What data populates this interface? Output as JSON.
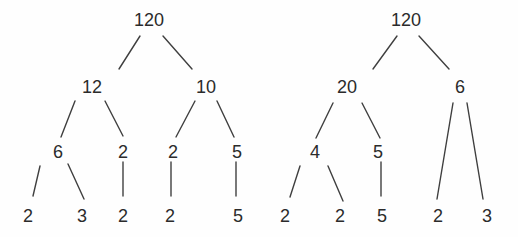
{
  "figure": {
    "background_color": "#fefefe",
    "line_color": "#3f3f3f",
    "text_color": "#2b2b2b",
    "line_width": 1.4,
    "trees": [
      {
        "name": "factor-tree-left",
        "root_value": "120",
        "factorization": "120 = 12 x 10, 12 = 6 x 2, 10 = 2 x 5, 6 = 2 x 3",
        "prime_leaves": [
          "2",
          "3",
          "2",
          "2",
          "5"
        ],
        "nodes": [
          {
            "id": "l-120",
            "label": "120",
            "x": 149,
            "y": 20
          },
          {
            "id": "l-12",
            "label": "12",
            "x": 92,
            "y": 87
          },
          {
            "id": "l-10",
            "label": "10",
            "x": 206,
            "y": 87
          },
          {
            "id": "l-6",
            "label": "6",
            "x": 58,
            "y": 152
          },
          {
            "id": "l-2a",
            "label": "2",
            "x": 123,
            "y": 152
          },
          {
            "id": "l-2b",
            "label": "2",
            "x": 173,
            "y": 152
          },
          {
            "id": "l-5",
            "label": "5",
            "x": 237,
            "y": 152
          },
          {
            "id": "l-leaf2a",
            "label": "2",
            "x": 28,
            "y": 216
          },
          {
            "id": "l-leaf3",
            "label": "3",
            "x": 82,
            "y": 216
          },
          {
            "id": "l-leaf2b",
            "label": "2",
            "x": 123,
            "y": 216
          },
          {
            "id": "l-leaf2c",
            "label": "2",
            "x": 170,
            "y": 216
          },
          {
            "id": "l-leaf5",
            "label": "5",
            "x": 238,
            "y": 216
          }
        ],
        "edges": [
          {
            "from": "l-120",
            "to": "l-12",
            "x1": 140,
            "y1": 36,
            "x2": 119,
            "y2": 69
          },
          {
            "from": "l-120",
            "to": "l-10",
            "x1": 163,
            "y1": 36,
            "x2": 192,
            "y2": 69
          },
          {
            "from": "l-12",
            "to": "l-6",
            "x1": 75,
            "y1": 101,
            "x2": 61,
            "y2": 137
          },
          {
            "from": "l-12",
            "to": "l-2a",
            "x1": 105,
            "y1": 101,
            "x2": 123,
            "y2": 136
          },
          {
            "from": "l-10",
            "to": "l-2b",
            "x1": 195,
            "y1": 101,
            "x2": 176,
            "y2": 137
          },
          {
            "from": "l-10",
            "to": "l-5",
            "x1": 217,
            "y1": 101,
            "x2": 234,
            "y2": 137
          },
          {
            "from": "l-6",
            "to": "l-leaf2a",
            "x1": 40,
            "y1": 166,
            "x2": 33,
            "y2": 196
          },
          {
            "from": "l-6",
            "to": "l-leaf3",
            "x1": 68,
            "y1": 164,
            "x2": 84,
            "y2": 199
          },
          {
            "from": "l-2a",
            "to": "l-leaf2b",
            "x1": 123,
            "y1": 162,
            "x2": 123,
            "y2": 196
          },
          {
            "from": "l-2b",
            "to": "l-leaf2c",
            "x1": 171,
            "y1": 162,
            "x2": 171,
            "y2": 196
          },
          {
            "from": "l-5",
            "to": "l-leaf5",
            "x1": 236,
            "y1": 162,
            "x2": 236,
            "y2": 196
          }
        ]
      },
      {
        "name": "factor-tree-right",
        "root_value": "120",
        "factorization": "120 = 20 x 6, 20 = 4 x 5, 4 = 2 x 2, 6 = 2 x 3",
        "prime_leaves": [
          "2",
          "2",
          "5",
          "2",
          "3"
        ],
        "nodes": [
          {
            "id": "r-120",
            "label": "120",
            "x": 406,
            "y": 20
          },
          {
            "id": "r-20",
            "label": "20",
            "x": 347,
            "y": 87
          },
          {
            "id": "r-6",
            "label": "6",
            "x": 460,
            "y": 87
          },
          {
            "id": "r-4",
            "label": "4",
            "x": 315,
            "y": 152
          },
          {
            "id": "r-5",
            "label": "5",
            "x": 378,
            "y": 152
          },
          {
            "id": "r-leaf2a",
            "label": "2",
            "x": 285,
            "y": 216
          },
          {
            "id": "r-leaf2b",
            "label": "2",
            "x": 340,
            "y": 216
          },
          {
            "id": "r-leaf5",
            "label": "5",
            "x": 382,
            "y": 216
          },
          {
            "id": "r-leaf2c",
            "label": "2",
            "x": 438,
            "y": 216
          },
          {
            "id": "r-leaf3",
            "label": "3",
            "x": 487,
            "y": 216
          }
        ],
        "edges": [
          {
            "from": "r-120",
            "to": "r-20",
            "x1": 397,
            "y1": 36,
            "x2": 373,
            "y2": 69
          },
          {
            "from": "r-120",
            "to": "r-6",
            "x1": 419,
            "y1": 36,
            "x2": 449,
            "y2": 69
          },
          {
            "from": "r-20",
            "to": "r-4",
            "x1": 333,
            "y1": 103,
            "x2": 316,
            "y2": 138
          },
          {
            "from": "r-20",
            "to": "r-5",
            "x1": 362,
            "y1": 103,
            "x2": 380,
            "y2": 138
          },
          {
            "from": "r-4",
            "to": "r-leaf2a",
            "x1": 300,
            "y1": 166,
            "x2": 290,
            "y2": 197
          },
          {
            "from": "r-4",
            "to": "r-leaf2b",
            "x1": 328,
            "y1": 166,
            "x2": 343,
            "y2": 201
          },
          {
            "from": "r-5",
            "to": "r-leaf5",
            "x1": 381,
            "y1": 162,
            "x2": 381,
            "y2": 196
          },
          {
            "from": "r-6",
            "to": "r-leaf2c",
            "x1": 453,
            "y1": 103,
            "x2": 437,
            "y2": 199
          },
          {
            "from": "r-6",
            "to": "r-leaf3",
            "x1": 467,
            "y1": 103,
            "x2": 483,
            "y2": 199
          }
        ]
      }
    ]
  }
}
